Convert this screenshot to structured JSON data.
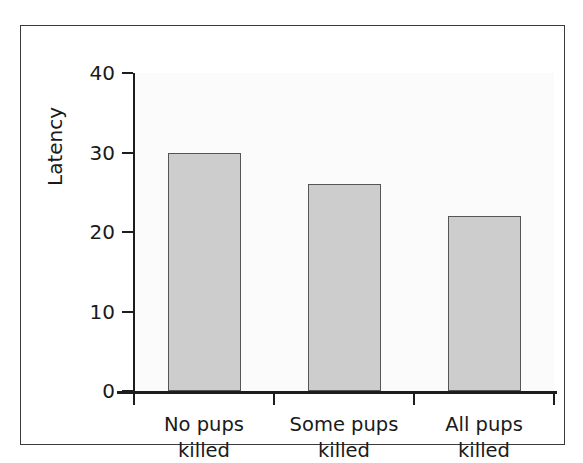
{
  "chart_data": {
    "type": "bar",
    "title": "",
    "subtitle": "",
    "xlabel": "",
    "ylabel": "Latency",
    "categories": [
      "No pups killed",
      "Some pups killed",
      "All pups killed"
    ],
    "category_lines": [
      [
        "No pups",
        "killed"
      ],
      [
        "Some pups",
        "killed"
      ],
      [
        "All pups",
        "killed"
      ]
    ],
    "values": [
      30,
      26,
      22
    ],
    "ylim": [
      0,
      40
    ],
    "y_ticks": [
      0,
      10,
      20,
      30,
      40
    ],
    "y_tick_labels": [
      "0",
      "10",
      "20",
      "30",
      "40"
    ],
    "grid": false,
    "legend": "none",
    "annotations": [],
    "colors": {
      "bar_fill": "#cdcdcd",
      "bar_edge": "#555555",
      "axis": "#1d1d1d",
      "text": "#1a1a1a",
      "plot_background": "#fbfbfb",
      "figure_background": "#ffffff",
      "frame_border": "#3a3a3a"
    }
  }
}
